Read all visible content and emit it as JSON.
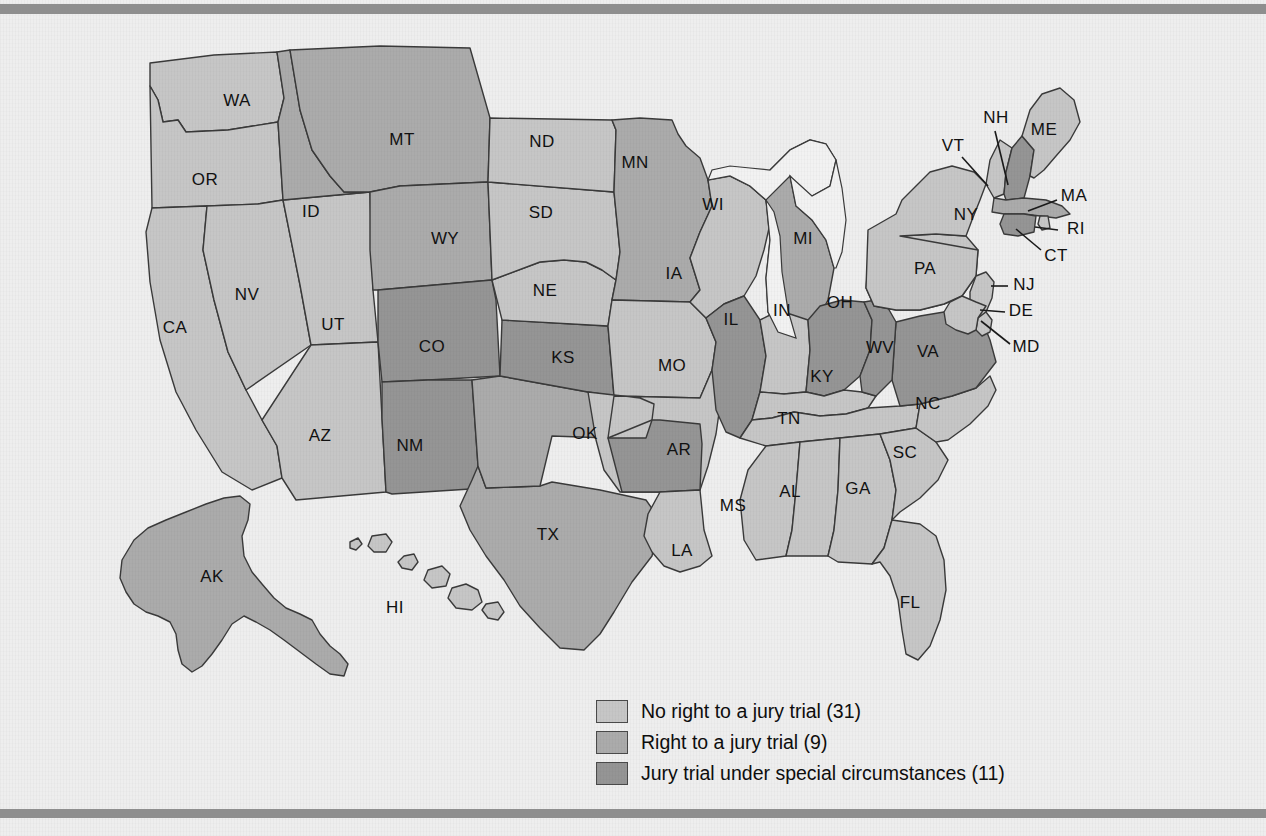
{
  "figure": {
    "type": "choropleth-map",
    "region": "United States",
    "background_color": "#eeeeee",
    "border_bar_color": "#8e8e8e",
    "outline_color": "#3a3a3a",
    "lake_color": "#f2f2f2"
  },
  "legend": {
    "items": [
      {
        "swatch_name": "legend-swatch-no-right",
        "color": "#c6c6c6",
        "label": "No right to a jury trial (31)",
        "category": "no-right",
        "count": 31
      },
      {
        "swatch_name": "legend-swatch-right",
        "color": "#ababab",
        "label": "Right to a jury trial (9)",
        "category": "right",
        "count": 9
      },
      {
        "swatch_name": "legend-swatch-special",
        "color": "#959595",
        "label": "Jury trial under special circumstances (11)",
        "category": "special",
        "count": 11
      }
    ]
  },
  "categories": {
    "no-right": "#c6c6c6",
    "right": "#ababab",
    "special": "#959595"
  },
  "chart_data": {
    "type": "heatmap",
    "title": "",
    "legend_position": "bottom-center",
    "categories": [
      "No right to a jury trial",
      "Right to a jury trial",
      "Jury trial under special circumstances"
    ],
    "values": [
      31,
      9,
      11
    ],
    "states": [
      {
        "code": "WA",
        "category": "no-right"
      },
      {
        "code": "OR",
        "category": "no-right"
      },
      {
        "code": "CA",
        "category": "no-right"
      },
      {
        "code": "NV",
        "category": "no-right"
      },
      {
        "code": "UT",
        "category": "no-right"
      },
      {
        "code": "AZ",
        "category": "no-right"
      },
      {
        "code": "ID",
        "category": "right"
      },
      {
        "code": "MT",
        "category": "right"
      },
      {
        "code": "WY",
        "category": "right"
      },
      {
        "code": "CO",
        "category": "special"
      },
      {
        "code": "NM",
        "category": "special"
      },
      {
        "code": "TX",
        "category": "right"
      },
      {
        "code": "OK",
        "category": "right"
      },
      {
        "code": "KS",
        "category": "special"
      },
      {
        "code": "NE",
        "category": "no-right"
      },
      {
        "code": "SD",
        "category": "no-right"
      },
      {
        "code": "ND",
        "category": "no-right"
      },
      {
        "code": "MN",
        "category": "right"
      },
      {
        "code": "IA",
        "category": "no-right"
      },
      {
        "code": "MO",
        "category": "no-right"
      },
      {
        "code": "AR",
        "category": "special"
      },
      {
        "code": "LA",
        "category": "no-right"
      },
      {
        "code": "WI",
        "category": "no-right"
      },
      {
        "code": "IL",
        "category": "special"
      },
      {
        "code": "MI",
        "category": "right"
      },
      {
        "code": "IN",
        "category": "no-right"
      },
      {
        "code": "OH",
        "category": "special"
      },
      {
        "code": "KY",
        "category": "no-right"
      },
      {
        "code": "TN",
        "category": "no-right"
      },
      {
        "code": "MS",
        "category": "no-right"
      },
      {
        "code": "AL",
        "category": "no-right"
      },
      {
        "code": "GA",
        "category": "no-right"
      },
      {
        "code": "FL",
        "category": "no-right"
      },
      {
        "code": "SC",
        "category": "no-right"
      },
      {
        "code": "NC",
        "category": "no-right"
      },
      {
        "code": "VA",
        "category": "special"
      },
      {
        "code": "WV",
        "category": "special"
      },
      {
        "code": "PA",
        "category": "no-right"
      },
      {
        "code": "NY",
        "category": "no-right"
      },
      {
        "code": "VT",
        "category": "no-right"
      },
      {
        "code": "NH",
        "category": "special"
      },
      {
        "code": "ME",
        "category": "no-right"
      },
      {
        "code": "MA",
        "category": "right"
      },
      {
        "code": "RI",
        "category": "no-right"
      },
      {
        "code": "CT",
        "category": "special"
      },
      {
        "code": "NJ",
        "category": "no-right"
      },
      {
        "code": "DE",
        "category": "no-right"
      },
      {
        "code": "MD",
        "category": "no-right"
      },
      {
        "code": "AK",
        "category": "right"
      },
      {
        "code": "HI",
        "category": "no-right"
      }
    ]
  },
  "labels": [
    {
      "code": "WA",
      "x": 237,
      "y": 101
    },
    {
      "code": "OR",
      "x": 205,
      "y": 180
    },
    {
      "code": "CA",
      "x": 175,
      "y": 328
    },
    {
      "code": "NV",
      "x": 247,
      "y": 295
    },
    {
      "code": "UT",
      "x": 333,
      "y": 325
    },
    {
      "code": "AZ",
      "x": 320,
      "y": 436
    },
    {
      "code": "ID",
      "x": 311,
      "y": 212
    },
    {
      "code": "MT",
      "x": 402,
      "y": 140
    },
    {
      "code": "WY",
      "x": 445,
      "y": 239
    },
    {
      "code": "CO",
      "x": 432,
      "y": 347
    },
    {
      "code": "NM",
      "x": 410,
      "y": 446
    },
    {
      "code": "TX",
      "x": 548,
      "y": 535
    },
    {
      "code": "OK",
      "x": 585,
      "y": 434
    },
    {
      "code": "KS",
      "x": 563,
      "y": 358
    },
    {
      "code": "NE",
      "x": 545,
      "y": 291
    },
    {
      "code": "SD",
      "x": 541,
      "y": 213
    },
    {
      "code": "ND",
      "x": 542,
      "y": 142
    },
    {
      "code": "MN",
      "x": 635,
      "y": 163
    },
    {
      "code": "IA",
      "x": 674,
      "y": 274
    },
    {
      "code": "MO",
      "x": 672,
      "y": 366
    },
    {
      "code": "AR",
      "x": 679,
      "y": 450
    },
    {
      "code": "LA",
      "x": 682,
      "y": 551
    },
    {
      "code": "WI",
      "x": 713,
      "y": 205
    },
    {
      "code": "IL",
      "x": 731,
      "y": 320
    },
    {
      "code": "MI",
      "x": 803,
      "y": 239
    },
    {
      "code": "IN",
      "x": 782,
      "y": 311
    },
    {
      "code": "OH",
      "x": 840,
      "y": 303
    },
    {
      "code": "KY",
      "x": 822,
      "y": 377
    },
    {
      "code": "TN",
      "x": 789,
      "y": 419
    },
    {
      "code": "MS",
      "x": 733,
      "y": 506
    },
    {
      "code": "AL",
      "x": 790,
      "y": 492
    },
    {
      "code": "GA",
      "x": 858,
      "y": 489
    },
    {
      "code": "FL",
      "x": 910,
      "y": 603
    },
    {
      "code": "SC",
      "x": 905,
      "y": 453
    },
    {
      "code": "NC",
      "x": 928,
      "y": 404
    },
    {
      "code": "VA",
      "x": 928,
      "y": 352
    },
    {
      "code": "WV",
      "x": 880,
      "y": 348
    },
    {
      "code": "PA",
      "x": 925,
      "y": 269
    },
    {
      "code": "NY",
      "x": 966,
      "y": 215
    },
    {
      "code": "VT",
      "x": 953,
      "y": 146
    },
    {
      "code": "NH",
      "x": 996,
      "y": 118
    },
    {
      "code": "ME",
      "x": 1044,
      "y": 130
    },
    {
      "code": "MA",
      "x": 1074,
      "y": 196
    },
    {
      "code": "RI",
      "x": 1076,
      "y": 229
    },
    {
      "code": "CT",
      "x": 1056,
      "y": 256
    },
    {
      "code": "NJ",
      "x": 1024,
      "y": 285
    },
    {
      "code": "DE",
      "x": 1021,
      "y": 311
    },
    {
      "code": "MD",
      "x": 1026,
      "y": 347
    },
    {
      "code": "AK",
      "x": 212,
      "y": 577
    },
    {
      "code": "HI",
      "x": 395,
      "y": 608
    }
  ]
}
